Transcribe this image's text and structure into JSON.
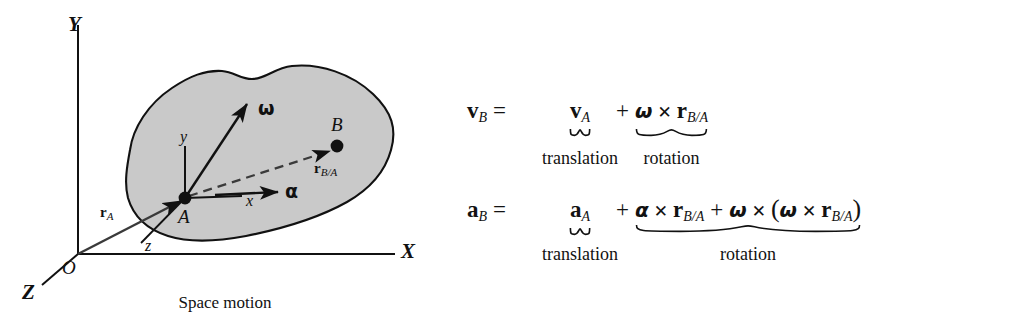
{
  "figure": {
    "caption": "Space motion",
    "body_fill": "#c9c9c9",
    "stroke": "#111111"
  },
  "diagram": {
    "global_axes": [
      {
        "id": "Y",
        "label": "Y"
      },
      {
        "id": "X",
        "label": "X"
      },
      {
        "id": "Z",
        "label": "Z"
      }
    ],
    "origin_label": "O",
    "local_axes": [
      {
        "id": "y",
        "label": "y"
      },
      {
        "id": "x",
        "label": "x"
      },
      {
        "id": "z",
        "label": "z"
      }
    ],
    "points": [
      {
        "id": "A",
        "label": "A"
      },
      {
        "id": "B",
        "label": "B"
      }
    ],
    "vectors": [
      {
        "id": "r_A",
        "base": "r",
        "sub": "A"
      },
      {
        "id": "r_BA",
        "base": "r",
        "sub": "B/A"
      }
    ],
    "omega_label": "ω",
    "alpha_label": "α"
  },
  "equations": [
    {
      "id": "velocity",
      "lhs": "v",
      "lhs_sub": "B",
      "equals": "=",
      "translation_term": {
        "base": "v",
        "sub": "A"
      },
      "plus": "+",
      "rotation_term": {
        "omega": "ω",
        "cross": "✕",
        "r": "r",
        "r_sub": "B/A"
      },
      "translation_label": "translation",
      "rotation_label": "rotation"
    },
    {
      "id": "acceleration",
      "lhs": "a",
      "lhs_sub": "B",
      "equals": "=",
      "translation_term": {
        "base": "a",
        "sub": "A"
      },
      "plus": "+",
      "rotation_term": {
        "alpha": "α",
        "cross": "✕",
        "r": "r",
        "r_sub": "B/A",
        "plus": "+",
        "omega": "ω",
        "open_paren": "(",
        "omega2": "ω",
        "cross2": "✕",
        "r2": "r",
        "r2_sub": "B/A",
        "close_paren": ")"
      },
      "translation_label": "translation",
      "rotation_label": "rotation"
    }
  ]
}
